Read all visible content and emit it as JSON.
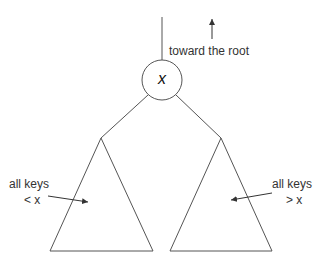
{
  "diagram": {
    "type": "binary-search-tree-node",
    "node": {
      "label": "x"
    },
    "root_direction": {
      "label": "toward the root",
      "icon": "arrow-up-icon"
    },
    "left_subtree": {
      "label_line1": "all keys",
      "label_line2": "< x",
      "icon": "arrow-right-icon"
    },
    "right_subtree": {
      "label_line1": "all keys",
      "label_line2": "> x",
      "icon": "arrow-left-icon"
    },
    "colors": {
      "stroke": "#555555",
      "text": "#333333",
      "background": "#ffffff"
    }
  }
}
